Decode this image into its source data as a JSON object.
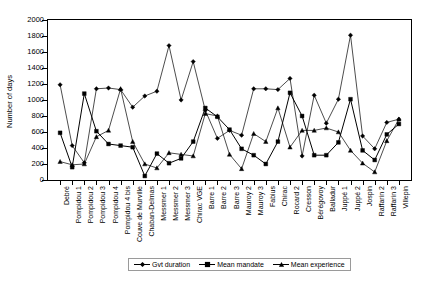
{
  "chart": {
    "ylabel": "Number of days",
    "yticks": [
      0,
      200,
      400,
      600,
      800,
      1000,
      1200,
      1400,
      1600,
      1800,
      2000
    ]
  },
  "legend": {
    "position": "bottom",
    "items": [
      {
        "label": "Gvt duration",
        "marker": "diamond"
      },
      {
        "label": "Mean mandate",
        "marker": "square"
      },
      {
        "label": "Mean experience",
        "marker": "triangle"
      }
    ]
  },
  "chart_data": {
    "type": "line",
    "title": "",
    "xlabel": "",
    "ylabel": "Number of days",
    "ylim": [
      0,
      2000
    ],
    "ytick_step": 200,
    "grid": false,
    "legend_position": "bottom",
    "categories": [
      "Debré",
      "Pompidou 1",
      "Pompidou 2",
      "Pompidou 3",
      "Pompidou 4",
      "Pompidou 4 bis",
      "Couve de Murville",
      "Chaban-Delmas",
      "Messmer 1",
      "Messmer 2",
      "Messmer 3",
      "Chirac VGE",
      "Barre 1",
      "Barre 2",
      "Barre 3",
      "Mauroy 2",
      "Mauroy 3",
      "Fabius",
      "Chirac",
      "Rocard 2",
      "Cresson",
      "Bérégovoy",
      "Balladur",
      "Juppé 1",
      "Juppé 2",
      "Jospin",
      "Raffarin 2",
      "Raffarin 3",
      "Villepin"
    ],
    "series": [
      {
        "name": "Gvt duration",
        "marker": "diamond",
        "values": [
          1190,
          430,
          215,
          1140,
          1150,
          1130,
          910,
          1050,
          1110,
          1680,
          1000,
          1480,
          870,
          520,
          620,
          560,
          1140,
          1140,
          1130,
          1270,
          300,
          1060,
          710,
          1010,
          1810,
          550,
          390,
          720,
          760
        ]
      },
      {
        "name": "Mean mandate",
        "marker": "square",
        "values": [
          590,
          160,
          1080,
          610,
          450,
          430,
          410,
          50,
          330,
          210,
          270,
          480,
          900,
          790,
          630,
          390,
          310,
          200,
          480,
          1090,
          800,
          310,
          310,
          470,
          1010,
          370,
          250,
          570,
          700
        ]
      },
      {
        "name": "Mean experience",
        "marker": "triangle",
        "values": [
          230,
          190,
          200,
          540,
          620,
          1140,
          480,
          200,
          150,
          340,
          320,
          300,
          830,
          800,
          320,
          140,
          580,
          480,
          900,
          410,
          620,
          620,
          650,
          600,
          370,
          210,
          100,
          490,
          760
        ]
      }
    ]
  }
}
